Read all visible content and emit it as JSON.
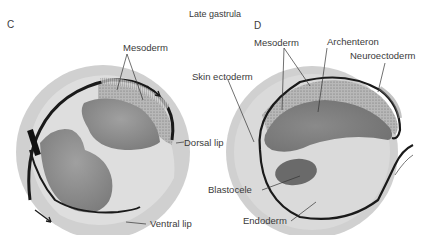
{
  "title": "Late gastrula",
  "panels": [
    {
      "id": "C",
      "label": "C",
      "structures": [
        "Mesoderm",
        "Dorsal lip",
        "Ventral lip"
      ],
      "arrows": [
        "dorsal-involution-arrow",
        "ventral-involution-arrow"
      ]
    },
    {
      "id": "D",
      "label": "D",
      "structures": [
        "Mesoderm",
        "Archenteron",
        "Neuroectoderm",
        "Skin ectoderm",
        "Blastocele",
        "Endoderm"
      ]
    }
  ],
  "labels": {
    "c_panel": "C",
    "d_panel": "D",
    "c_mesoderm": "Mesoderm",
    "c_dorsal_lip": "Dorsal lip",
    "c_ventral_lip": "Ventral lip",
    "d_mesoderm": "Mesoderm",
    "d_archenteron": "Archenteron",
    "d_neuroectoderm": "Neuroectoderm",
    "d_skin_ectoderm": "Skin ectoderm",
    "d_blastocele": "Blastocele",
    "d_endoderm": "Endoderm"
  },
  "colors": {
    "outer_layer": "#d2d2d2",
    "inner_yolk": "#dcdcdc",
    "cavity": "#8c8c8c",
    "line": "#1a1a1a",
    "mesoderm_stipple": "#a8a8a8"
  }
}
